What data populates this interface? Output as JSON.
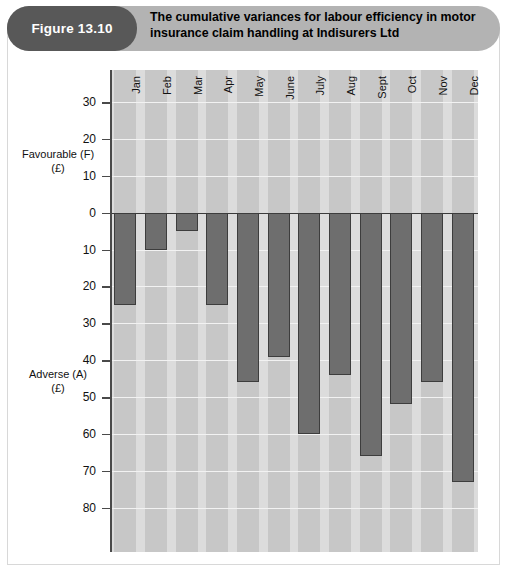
{
  "figure": {
    "badge_label": "Figure 13.10",
    "title": "The cumulative variances for labour efficiency in motor insurance claim handling at Indisurers Ltd"
  },
  "axis_captions": {
    "favourable_line1": "Favourable (F)",
    "favourable_line2": "(£)",
    "adverse_line1": "Adverse (A)",
    "adverse_line2": "(£)"
  },
  "colors": {
    "badge": "#585858",
    "banner": "#b3b3b3",
    "plot_background": "#dcdcdc",
    "band": "#c7c7c7",
    "bar_fill": "#6e6e6e",
    "bar_stroke": "#3d3d3d",
    "axis": "#4a4a4a"
  },
  "chart_data": {
    "type": "bar",
    "title": "The cumulative variances for labour efficiency in motor insurance claim handling at Indisurers Ltd",
    "xlabel": "",
    "ylabel": "Favourable (F) (£) / Adverse (A) (£)",
    "grid": true,
    "legend": "none",
    "orientation": "vertical",
    "note": "Values are plotted downward from zero (adverse variances). Axis labels are unsigned magnitudes: above zero 10/20/30 = favourable, below zero 10..80 = adverse.",
    "categories": [
      "Jan",
      "Feb",
      "Mar",
      "Apr",
      "May",
      "June",
      "July",
      "Aug",
      "Sept",
      "Oct",
      "Nov",
      "Dec"
    ],
    "values": [
      -25,
      -10,
      -5,
      -25,
      -46,
      -39,
      -60,
      -44,
      -66,
      -52,
      -46,
      -73
    ],
    "value_magnitudes": [
      25,
      10,
      5,
      25,
      46,
      39,
      60,
      44,
      66,
      52,
      46,
      73
    ],
    "ylim": [
      -92,
      38.7
    ],
    "yticks": [
      30,
      20,
      10,
      0,
      -10,
      -20,
      -30,
      -40,
      -50,
      -60,
      -70,
      -80
    ],
    "ytick_labels": [
      "30",
      "20",
      "10",
      "0",
      "10",
      "20",
      "30",
      "40",
      "50",
      "60",
      "70",
      "80"
    ]
  }
}
